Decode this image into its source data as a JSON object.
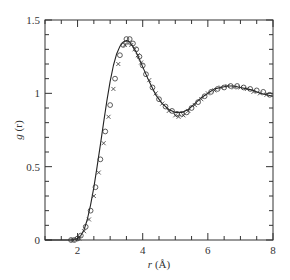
{
  "chart_data": {
    "type": "line",
    "title": "",
    "xlabel": "r (Å)",
    "ylabel": "g (r)",
    "xlim": [
      1,
      8
    ],
    "ylim": [
      0,
      1.5
    ],
    "x_ticks": [
      2,
      4,
      6,
      8
    ],
    "x_tick_labels": [
      "2",
      "4",
      "6",
      "8"
    ],
    "x_minor_step": 0.5,
    "y_ticks": [
      0,
      0.5,
      1,
      1.5
    ],
    "y_tick_labels": [
      "0",
      "0.5",
      "1",
      "1.5"
    ],
    "y_minor_step": 0.1,
    "grid": false,
    "legend": null,
    "series": [
      {
        "name": "model (solid line)",
        "style": "line",
        "x": [
          1.0,
          1.8,
          2.0,
          2.1,
          2.2,
          2.3,
          2.4,
          2.5,
          2.6,
          2.7,
          2.8,
          2.9,
          3.0,
          3.1,
          3.2,
          3.3,
          3.4,
          3.5,
          3.6,
          3.7,
          3.8,
          3.9,
          4.0,
          4.2,
          4.4,
          4.6,
          4.8,
          5.0,
          5.2,
          5.4,
          5.6,
          5.8,
          6.0,
          6.2,
          6.4,
          6.6,
          6.8,
          7.0,
          7.2,
          7.4,
          7.6,
          7.8,
          8.0
        ],
        "y": [
          0.0,
          0.0,
          0.01,
          0.03,
          0.07,
          0.14,
          0.24,
          0.36,
          0.5,
          0.65,
          0.8,
          0.95,
          1.08,
          1.19,
          1.27,
          1.32,
          1.35,
          1.36,
          1.35,
          1.32,
          1.28,
          1.23,
          1.18,
          1.08,
          0.99,
          0.93,
          0.89,
          0.87,
          0.87,
          0.89,
          0.93,
          0.97,
          1.0,
          1.03,
          1.04,
          1.05,
          1.05,
          1.04,
          1.03,
          1.02,
          1.0,
          0.99,
          0.98
        ]
      },
      {
        "name": "data (open circles)",
        "style": "circle",
        "x": [
          1.8,
          1.9,
          2.0,
          2.1,
          2.25,
          2.4,
          2.55,
          2.7,
          2.85,
          3.0,
          3.15,
          3.3,
          3.4,
          3.5,
          3.6,
          3.7,
          3.8,
          3.9,
          4.0,
          4.1,
          4.3,
          4.5,
          4.7,
          4.9,
          5.05,
          5.2,
          5.35,
          5.5,
          5.7,
          5.9,
          6.1,
          6.3,
          6.5,
          6.7,
          6.9,
          7.1,
          7.3,
          7.5,
          7.7,
          7.9
        ],
        "y": [
          0.0,
          0.0,
          0.01,
          0.03,
          0.09,
          0.2,
          0.36,
          0.55,
          0.74,
          0.92,
          1.1,
          1.26,
          1.33,
          1.37,
          1.37,
          1.34,
          1.3,
          1.25,
          1.19,
          1.13,
          1.04,
          0.96,
          0.91,
          0.88,
          0.86,
          0.86,
          0.87,
          0.9,
          0.94,
          0.98,
          1.01,
          1.03,
          1.04,
          1.05,
          1.05,
          1.04,
          1.03,
          1.02,
          1.01,
          0.99
        ]
      },
      {
        "name": "data (crosses)",
        "style": "cross",
        "x": [
          1.85,
          2.05,
          2.2,
          2.35,
          2.5,
          2.65,
          2.8,
          2.95,
          3.1,
          3.25,
          3.45,
          3.55,
          3.65,
          3.75,
          3.85,
          3.95,
          4.2,
          4.4,
          4.6,
          4.8,
          5.0,
          5.1,
          5.25,
          5.4,
          5.6,
          5.8,
          6.0,
          6.2,
          6.4,
          6.6,
          6.8,
          7.0,
          7.2,
          7.4,
          7.6,
          7.8
        ],
        "y": [
          0.0,
          0.01,
          0.06,
          0.14,
          0.3,
          0.46,
          0.66,
          0.84,
          1.03,
          1.2,
          1.33,
          1.34,
          1.33,
          1.3,
          1.26,
          1.21,
          1.09,
          1.0,
          0.93,
          0.88,
          0.85,
          0.84,
          0.85,
          0.88,
          0.92,
          0.96,
          1.0,
          1.02,
          1.04,
          1.05,
          1.04,
          1.04,
          1.03,
          1.01,
          1.0,
          0.99
        ]
      }
    ]
  }
}
